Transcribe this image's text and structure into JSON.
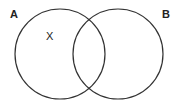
{
  "diagram": {
    "type": "venn",
    "sets": [
      {
        "label": "A",
        "cx": 60,
        "cy": 54,
        "r": 45
      },
      {
        "label": "B",
        "cx": 118,
        "cy": 54,
        "r": 45
      }
    ],
    "marker": {
      "text": "X",
      "region": "A only"
    },
    "colors": {
      "stroke": "#333333",
      "text": "#222222",
      "background": "#ffffff"
    }
  }
}
